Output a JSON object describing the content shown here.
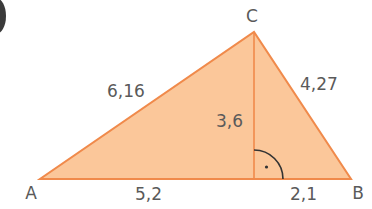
{
  "diagram": {
    "type": "triangle-with-altitude",
    "colors": {
      "fill": "#fbc79a",
      "stroke": "#f08a4b",
      "label": "#5a5a5a",
      "angle_mark": "#333333"
    },
    "vertices": {
      "A": {
        "label": "A",
        "x": 40,
        "y": 179
      },
      "B": {
        "label": "B",
        "x": 351,
        "y": 179
      },
      "C": {
        "label": "C",
        "x": 254,
        "y": 32
      },
      "H": {
        "x": 254,
        "y": 179
      }
    },
    "measures": {
      "AC": "6,16",
      "BC": "4,27",
      "CH": "3,6",
      "AH": "5,2",
      "HB": "2,1"
    },
    "right_angle_marker": true
  }
}
